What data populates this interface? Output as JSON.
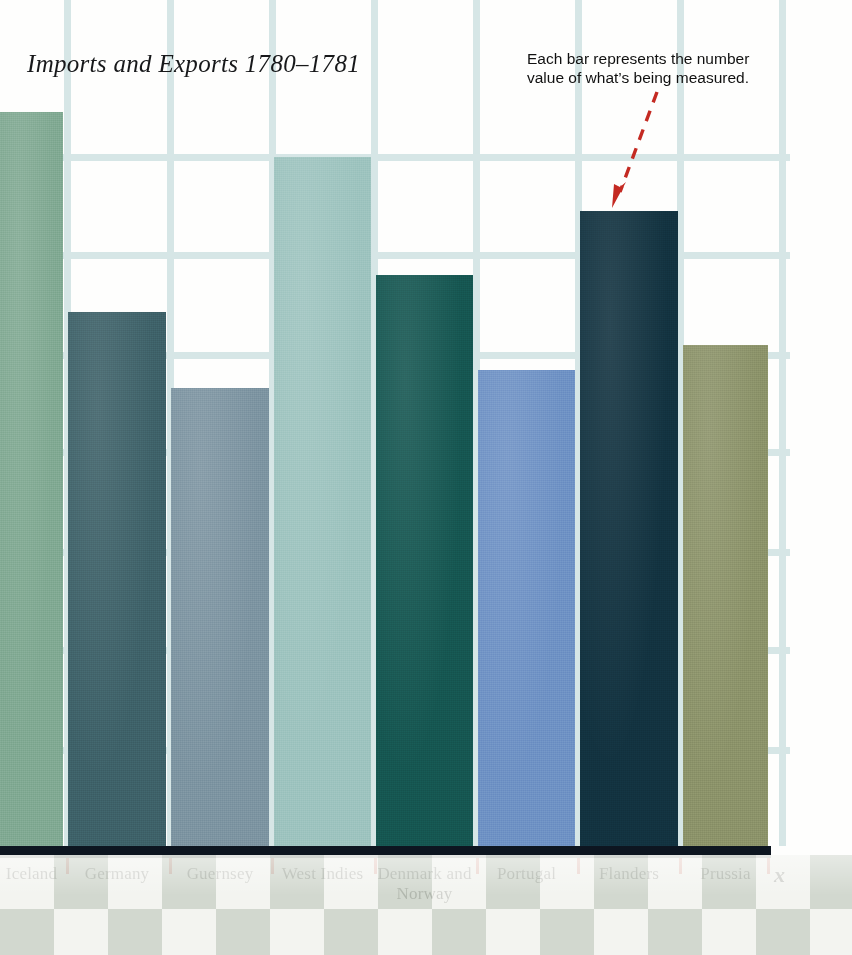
{
  "chart_data": {
    "type": "bar",
    "title": "Imports and Exports 1780–1781",
    "xlabel": "x",
    "ylabel": "",
    "categories": [
      "Iceland",
      "Germany",
      "Guernsey",
      "West Indies",
      "Denmark and Norway",
      "Portugal",
      "Flanders",
      "Prussia"
    ],
    "values": [
      100,
      72.7,
      62.4,
      94.0,
      77.8,
      64.8,
      86.4,
      68.2
    ],
    "bar_colors": [
      "#7fa891",
      "#3d6067",
      "#7b93a0",
      "#9cc3be",
      "#155550",
      "#6d90c4",
      "#12323f",
      "#8a9168"
    ],
    "bar_tops_px": [
      112,
      312,
      388,
      157,
      275,
      370,
      211,
      345
    ],
    "baseline_px": 846,
    "grid": true,
    "gridlines_h_px": [
      157,
      255,
      355,
      452,
      552,
      650,
      750
    ],
    "gridlines_v_px": [
      68,
      170,
      272,
      375,
      477,
      578,
      680,
      782
    ],
    "legend": "none",
    "annotation": "Each bar represents the number value of what’s being measured."
  },
  "header": {
    "title": "Imports and Exports 1780–1781"
  },
  "annotation": {
    "line1": "Each bar represents the number",
    "line2": "value of what’s being measured.",
    "arrow_color": "#c42a22",
    "target": "Flanders"
  },
  "axis": {
    "x_name": "x",
    "line_color": "#0d1520",
    "tick_color": "#d03a31"
  },
  "bars": [
    {
      "label": "Iceland",
      "color": "#7fa891",
      "value": 100,
      "left": 0,
      "width": 63,
      "top": 112
    },
    {
      "label": "Germany",
      "color": "#3d6067",
      "value": 72.7,
      "left": 68,
      "width": 98,
      "top": 312
    },
    {
      "label": "Guernsey",
      "color": "#7b93a0",
      "value": 62.4,
      "left": 171,
      "width": 98,
      "top": 388
    },
    {
      "label": "West Indies",
      "color": "#9cc3be",
      "value": 94.0,
      "left": 274,
      "width": 97,
      "top": 157
    },
    {
      "label": "Denmark and Norway",
      "color": "#155550",
      "value": 77.8,
      "left": 376,
      "width": 97,
      "top": 275
    },
    {
      "label": "Portugal",
      "color": "#6d90c4",
      "value": 64.8,
      "left": 478,
      "width": 97,
      "top": 370
    },
    {
      "label": "Flanders",
      "color": "#12323f",
      "value": 86.4,
      "left": 580,
      "width": 98,
      "top": 211
    },
    {
      "label": "Prussia",
      "color": "#8a9168",
      "value": 68.2,
      "left": 683,
      "width": 85,
      "top": 345
    }
  ],
  "ticks_px": [
    66,
    169,
    271,
    374,
    476,
    577,
    679,
    767
  ],
  "gridlines": {
    "horizontal_px": [
      157,
      255,
      355,
      452,
      552,
      650,
      750
    ],
    "vertical_px": [
      64,
      167,
      269,
      371,
      473,
      575,
      677,
      779
    ],
    "color": "#d6e6e6",
    "stub_right_px": 790
  },
  "floor": {
    "pattern": "diamond-checkerboard",
    "color_light": "#f2f3ee",
    "color_dark": "#cbd2c7"
  }
}
